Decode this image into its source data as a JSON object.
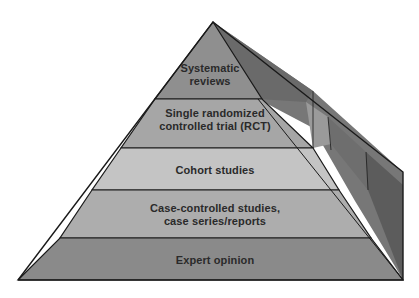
{
  "diagram": {
    "type": "pyramid",
    "title": "",
    "levels": [
      {
        "label_line1": "Systematic",
        "label_line2": "reviews",
        "color": "#8f8f8f"
      },
      {
        "label_line1": "Single randomized",
        "label_line2": "controlled trial (RCT)",
        "color": "#a6a6a6"
      },
      {
        "label_line1": "Cohort studies",
        "label_line2": "",
        "color": "#c4c4c4"
      },
      {
        "label_line1": "Case-controlled studies,",
        "label_line2": "case series/reports",
        "color": "#acacac"
      },
      {
        "label_line1": "Expert opinion",
        "label_line2": "",
        "color": "#8a8a8a"
      }
    ],
    "side_colors": [
      "#5f5f5f",
      "#7e7e7e"
    ]
  }
}
